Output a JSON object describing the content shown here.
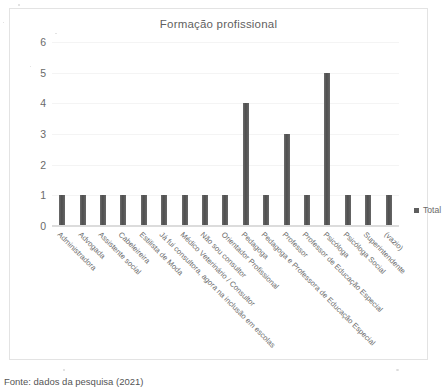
{
  "chart_data": {
    "type": "bar",
    "title": "Formação profissional",
    "xlabel": "",
    "ylabel": "",
    "ylim": [
      0,
      6
    ],
    "yticks": [
      "0",
      "1",
      "2",
      "3",
      "4",
      "5",
      "6"
    ],
    "grid": true,
    "legend_position": "right",
    "bar_color": "#5e5e5e",
    "categories": [
      "Administradora",
      "Advogada",
      "Assistente social",
      "Cabeleireira",
      "Estilista de Moda",
      "Já fui consultora, agora na inclusão em escolas",
      "Médico Veterinário / Consultor",
      "Não sou consultor",
      "Orientador Profissional",
      "Pedagoga",
      "Pedagoga e Professora de Educação Especial",
      "Professor",
      "Professor de Educação Especial",
      "Psicóloga",
      "Psicóloga Social",
      "Superintendente",
      "(vazio)"
    ],
    "series": [
      {
        "name": "Total",
        "values": [
          1,
          1,
          1,
          1,
          1,
          1,
          1,
          1,
          1,
          4,
          1,
          3,
          1,
          5,
          1,
          1,
          1
        ]
      }
    ],
    "values": [
      1,
      1,
      1,
      1,
      1,
      1,
      1,
      1,
      1,
      4,
      1,
      3,
      1,
      5,
      1,
      1,
      1
    ]
  },
  "legend": {
    "entries": [
      {
        "label": "Total",
        "color": "#5e5e5e"
      }
    ]
  },
  "caption": {
    "text": "Fonte: dados da pesquisa (2021)"
  }
}
